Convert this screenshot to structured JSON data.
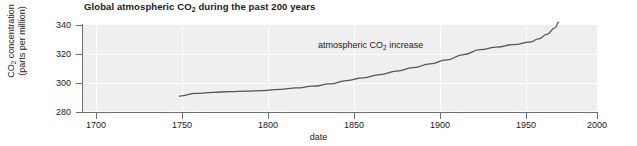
{
  "chart_data": {
    "type": "line",
    "title": "Global atmospheric CO2 during the past 200 years",
    "title_prefix": "Global atmospheric CO",
    "title_sub": "2",
    "title_suffix": " during the past 200 years",
    "xlabel": "date",
    "ylabel_line1_prefix": "CO",
    "ylabel_line1_sub": "2",
    "ylabel_line1_suffix": " concentration",
    "ylabel_line2": "(parts per million)",
    "ylabel": "CO2 concentration (parts per million)",
    "annotation_prefix": "atmospheric CO",
    "annotation_sub": "2",
    "annotation_suffix": " increase",
    "annotation": "atmospheric CO2 increase",
    "xlim": [
      1680,
      2000
    ],
    "ylim": [
      280,
      340
    ],
    "xticks": [
      "1700",
      "1750",
      "1800",
      "1850",
      "1900",
      "1950",
      "2000"
    ],
    "xtick_values": [
      1700,
      1750,
      1800,
      1850,
      1900,
      1950,
      2000
    ],
    "yticks": [
      "280",
      "300",
      "320",
      "340"
    ],
    "ytick_values": [
      280,
      300,
      320,
      340
    ],
    "grid": "white gridlines on light gray plot background",
    "legend": "none",
    "series": [
      {
        "name": "atmospheric CO2 increase",
        "color": "#555555",
        "x": [
          1750,
          1760,
          1770,
          1780,
          1790,
          1800,
          1810,
          1820,
          1830,
          1840,
          1850,
          1860,
          1870,
          1880,
          1890,
          1900,
          1910,
          1920,
          1930,
          1940,
          1950,
          1960,
          1965,
          1970,
          1975,
          1977
        ],
        "values": [
          291.0,
          292.8,
          293.6,
          294.0,
          294.4,
          294.8,
          295.6,
          296.6,
          297.8,
          299.4,
          301.6,
          303.6,
          305.8,
          308.2,
          310.6,
          313.2,
          316.0,
          319.6,
          323.0,
          324.8,
          326.4,
          328.2,
          330.4,
          333.6,
          338.2,
          342.0
        ]
      }
    ]
  },
  "plot_colors": {
    "background": "#efefef",
    "gridline": "#ffffff",
    "axis": "#6e6e6e",
    "line": "#555555",
    "text": "#1a1a1a",
    "canvas": "#ffffff"
  }
}
